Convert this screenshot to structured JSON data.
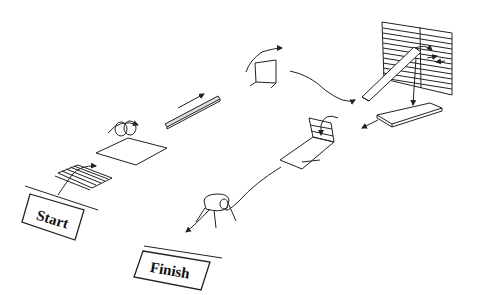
{
  "diagram": {
    "type": "obstacle-course",
    "labels": {
      "start": "Start",
      "finish": "Finish"
    },
    "stations": [
      {
        "id": "ladder-mat",
        "description": "flat ladder on ground"
      },
      {
        "id": "hoops-mat",
        "description": "two rings over a mat"
      },
      {
        "id": "balance-beam",
        "description": "narrow beam with arrow"
      },
      {
        "id": "hurdle",
        "description": "small jump frame"
      },
      {
        "id": "climbing-wall-ramp",
        "description": "slatted wall with ramp and landing mat"
      },
      {
        "id": "slide-box",
        "description": "box with slide ramp"
      },
      {
        "id": "tunnel",
        "description": "small tunnel / barrel on legs"
      }
    ],
    "colors": {
      "line": "#222222",
      "background": "#ffffff"
    }
  }
}
